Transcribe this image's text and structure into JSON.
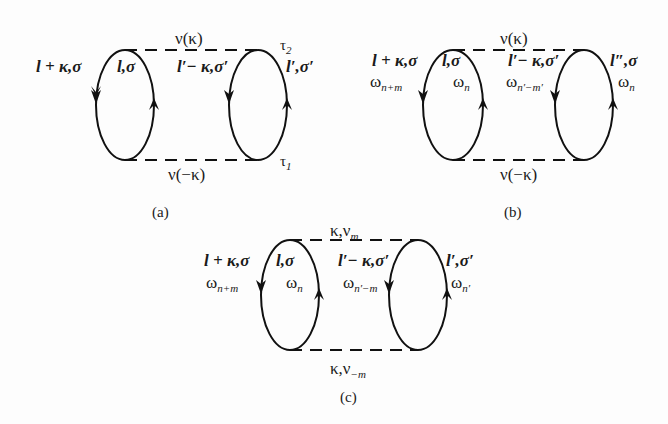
{
  "figure": {
    "panels": [
      {
        "id": "a",
        "caption": "(a)",
        "top_line": "ν(κ)",
        "bottom_line": "ν(−κ)",
        "left_loop_outer": "l + κ,σ",
        "left_loop_inner": "l,σ",
        "right_loop_inner": "l′− κ,σ′",
        "right_loop_outer": "l′,σ′",
        "tau_top": "τ",
        "tau_top_sub": "2",
        "tau_bottom": "τ",
        "tau_bottom_sub": "1"
      },
      {
        "id": "b",
        "caption": "(b)",
        "top_line": "ν(κ)",
        "bottom_line": "ν(−κ)",
        "left_loop_outer": "l + κ,σ",
        "left_loop_inner": "l,σ",
        "right_loop_inner": "l′− κ,σ′",
        "right_loop_outer": "l″,σ",
        "freq_left_outer": "ω",
        "freq_left_outer_sub": "n+m",
        "freq_left_inner": "ω",
        "freq_left_inner_sub": "n",
        "freq_right_inner": "ω",
        "freq_right_inner_sub": "n′−m′",
        "freq_right_outer": "ω",
        "freq_right_outer_sub": "n"
      },
      {
        "id": "c",
        "caption": "(c)",
        "top_line": "κ,ν",
        "top_line_sub": "m",
        "bottom_line": "κ,ν",
        "bottom_line_sub": "−m",
        "left_loop_outer": "l + κ,σ",
        "left_loop_inner": "l,σ",
        "right_loop_inner": "l′− κ,σ′",
        "right_loop_outer": "l′,σ′",
        "freq_left_outer": "ω",
        "freq_left_outer_sub": "n+m",
        "freq_left_inner": "ω",
        "freq_left_inner_sub": "n",
        "freq_right_inner": "ω",
        "freq_right_inner_sub": "n′−m",
        "freq_right_outer": "ω",
        "freq_right_outer_sub": "n′"
      }
    ]
  }
}
